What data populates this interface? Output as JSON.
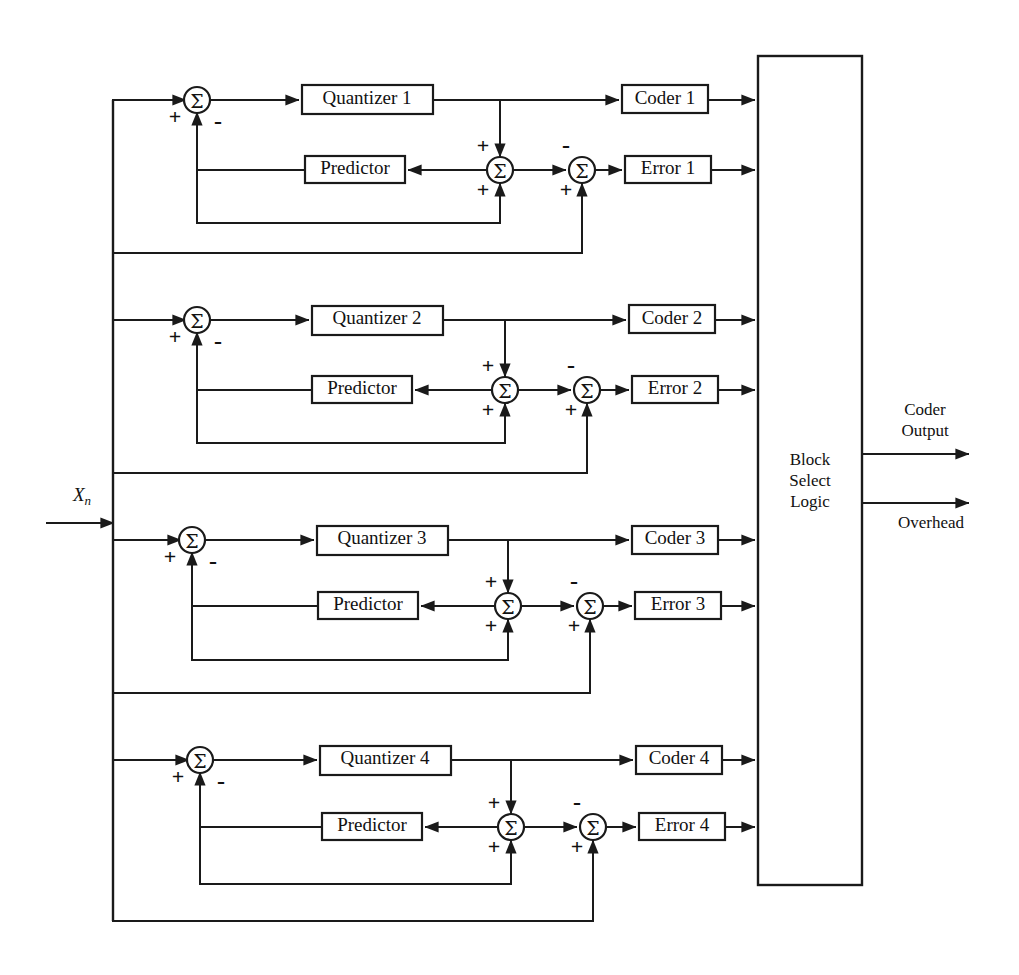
{
  "diagram": {
    "input_label": "X",
    "input_subscript": "n",
    "sigma_glyph": "Σ",
    "plus_sign": "+",
    "minus_sign": "-",
    "block_select": {
      "line1": "Block",
      "line2": "Select",
      "line3": "Logic"
    },
    "outputs": [
      {
        "name": "coder-output",
        "line1": "Coder",
        "line2": "Output"
      },
      {
        "name": "overhead-output",
        "line1": "Overhead",
        "line2": ""
      }
    ],
    "sections": [
      {
        "id": 1,
        "quantizer": "Quantizer 1",
        "predictor": "Predictor",
        "coder": "Coder 1",
        "error": "Error 1"
      },
      {
        "id": 2,
        "quantizer": "Quantizer 2",
        "predictor": "Predictor",
        "coder": "Coder 2",
        "error": "Error 2"
      },
      {
        "id": 3,
        "quantizer": "Quantizer 3",
        "predictor": "Predictor",
        "coder": "Coder 3",
        "error": "Error 3"
      },
      {
        "id": 4,
        "quantizer": "Quantizer 4",
        "predictor": "Predictor",
        "coder": "Coder 4",
        "error": "Error 4"
      }
    ],
    "colors": {
      "line": "#1a1a1a",
      "background": "#ffffff",
      "text": "#111111"
    }
  }
}
